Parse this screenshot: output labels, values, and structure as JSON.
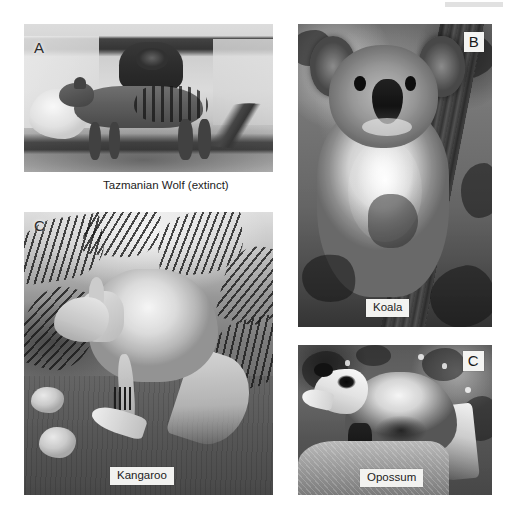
{
  "figure": {
    "background_color": "#ffffff",
    "style": "grayscale photographic plate"
  },
  "panels": [
    {
      "id": "panel-a",
      "letter": "A",
      "letter_style": "plain",
      "caption": "Tazmanian Wolf (extinct)",
      "caption_style": "below-photo",
      "subject": "thylacine",
      "alt": "Historic black and white photograph of two Tasmanian wolves (thylacines) standing in an enclosure, the nearer animal showing dark stripes across its hindquarters"
    },
    {
      "id": "panel-b",
      "letter": "B",
      "letter_style": "boxed",
      "caption": "Koala",
      "caption_style": "boxed-on-photo",
      "subject": "koala",
      "alt": "Grayscale photograph of a koala clinging to a eucalyptus tree trunk, facing the camera with large round ears and a broad dark nose"
    },
    {
      "id": "panel-c",
      "letter": "C",
      "letter_style": "plain",
      "caption": "Kangaroo",
      "caption_style": "boxed-on-photo",
      "subject": "kangaroo",
      "alt": "Grayscale photograph of a kangaroo standing among ferns on rocky ground, head lowered and long hind foot extended forward"
    },
    {
      "id": "panel-d",
      "letter": "C",
      "letter_style": "boxed",
      "caption": "Opossum",
      "caption_style": "boxed-on-photo",
      "subject": "opossum",
      "alt": "Grayscale photograph of an opossum standing on a rock in front of dark foliage, showing a pale pointed face and coarse grizzled fur"
    }
  ],
  "colors": {
    "page_background": "#ffffff",
    "caption_box_background": "#f2f2f0",
    "caption_text": "#1c1c1c",
    "label_text": "#1a1a1a"
  }
}
